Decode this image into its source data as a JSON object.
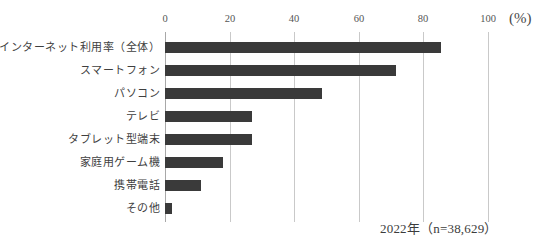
{
  "chart_data": {
    "type": "bar",
    "orientation": "horizontal",
    "title": "",
    "xlabel": "(%)",
    "ylabel": "",
    "xlim": [
      0,
      100
    ],
    "grid": true,
    "legend": null,
    "unit_label": "(%)",
    "xticks": [
      "0",
      "20",
      "40",
      "60",
      "80",
      "100"
    ],
    "xtick_values": [
      0,
      20,
      40,
      60,
      80,
      100
    ],
    "categories": [
      "インターネット利用率（全体）",
      "スマートフォン",
      "パソコン",
      "テレビ",
      "タブレット型端末",
      "家庭用ゲーム機",
      "携帯電話",
      "その他"
    ],
    "values": [
      85.4,
      71.5,
      48.5,
      27.0,
      26.8,
      18.0,
      11.0,
      2.3
    ],
    "bar_color": "#3a3a3a",
    "gridline_color": "#c9c9c9",
    "annotation": "2022年（n=38,629）"
  }
}
